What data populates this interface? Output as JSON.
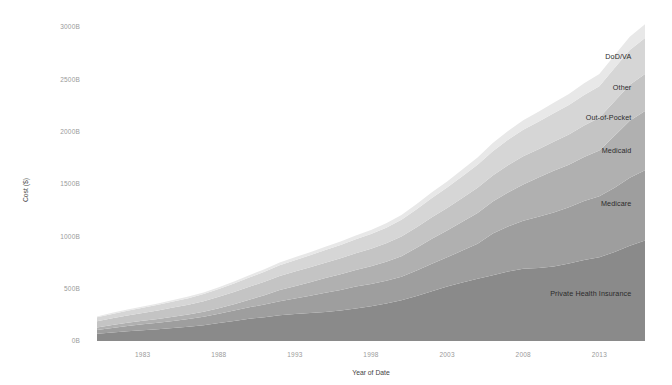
{
  "chart_data": {
    "type": "area",
    "stacked": true,
    "title": "",
    "xlabel": "Year of Date",
    "ylabel": "Cost ($)",
    "xlim": [
      1980,
      2016
    ],
    "ylim": [
      0,
      3000
    ],
    "grid": false,
    "legend_position": "inline-right",
    "x_tick_labels": [
      "1983",
      "1988",
      "1993",
      "1998",
      "2003",
      "2008",
      "2013"
    ],
    "x_ticks": [
      1983,
      1988,
      1993,
      1998,
      2003,
      2008,
      2013
    ],
    "y_tick_labels": [
      "0B",
      "500B",
      "1000B",
      "1500B",
      "2000B",
      "2500B",
      "3000B"
    ],
    "y_ticks": [
      0,
      500,
      1000,
      1500,
      2000,
      2500,
      3000
    ],
    "x": [
      1980,
      1981,
      1982,
      1983,
      1984,
      1985,
      1986,
      1987,
      1988,
      1989,
      1990,
      1991,
      1992,
      1993,
      1994,
      1995,
      1996,
      1997,
      1998,
      1999,
      2000,
      2001,
      2002,
      2003,
      2004,
      2005,
      2006,
      2007,
      2008,
      2009,
      2010,
      2011,
      2012,
      2013,
      2014,
      2015,
      2016
    ],
    "series": [
      {
        "name": "Private Health Insurance",
        "color": "#8a8a8a",
        "values": [
          70,
          82,
          94,
          103,
          113,
          124,
          135,
          150,
          172,
          192,
          212,
          228,
          246,
          259,
          268,
          278,
          292,
          310,
          333,
          359,
          390,
          430,
          475,
          520,
          560,
          595,
          628,
          665,
          690,
          698,
          712,
          740,
          775,
          800,
          850,
          910,
          960
        ]
      },
      {
        "name": "Medicare",
        "color": "#9e9e9e",
        "values": [
          36,
          43,
          50,
          56,
          61,
          68,
          74,
          81,
          88,
          99,
          110,
          120,
          134,
          146,
          164,
          182,
          196,
          210,
          212,
          216,
          224,
          243,
          262,
          279,
          305,
          335,
          398,
          428,
          459,
          489,
          516,
          538,
          562,
          583,
          615,
          649,
          672
        ]
      },
      {
        "name": "Medicaid",
        "color": "#b0b0b0",
        "values": [
          24,
          29,
          31,
          34,
          37,
          40,
          44,
          49,
          54,
          61,
          72,
          89,
          107,
          119,
          130,
          142,
          150,
          159,
          168,
          181,
          196,
          218,
          240,
          257,
          275,
          294,
          306,
          325,
          347,
          374,
          398,
          406,
          422,
          438,
          496,
          545,
          565
        ]
      },
      {
        "name": "Out-of-Pocket",
        "color": "#c4c4c4",
        "values": [
          58,
          63,
          69,
          75,
          81,
          87,
          93,
          100,
          108,
          116,
          124,
          129,
          134,
          139,
          142,
          146,
          152,
          159,
          168,
          177,
          188,
          196,
          205,
          214,
          226,
          239,
          250,
          261,
          268,
          271,
          278,
          289,
          300,
          311,
          330,
          344,
          353
        ]
      },
      {
        "name": "Other",
        "color": "#d6d6d6",
        "values": [
          38,
          42,
          46,
          50,
          54,
          58,
          63,
          68,
          74,
          81,
          89,
          96,
          103,
          109,
          115,
          121,
          127,
          133,
          141,
          150,
          160,
          172,
          185,
          196,
          208,
          220,
          232,
          244,
          255,
          263,
          272,
          282,
          292,
          302,
          318,
          332,
          344
        ]
      },
      {
        "name": "DoD/VA",
        "color": "#e8e8e8",
        "values": [
          9,
          10,
          11,
          12,
          13,
          14,
          15,
          16,
          18,
          20,
          22,
          24,
          26,
          28,
          30,
          32,
          34,
          36,
          39,
          42,
          45,
          49,
          54,
          59,
          65,
          71,
          77,
          83,
          89,
          95,
          101,
          106,
          111,
          116,
          122,
          128,
          133
        ]
      }
    ],
    "series_label_positions": [
      {
        "name": "Private Health Insurance",
        "x": 2013,
        "y": 430
      },
      {
        "name": "Medicare",
        "x": 2013,
        "y": 1290
      },
      {
        "name": "Medicaid",
        "x": 2013,
        "y": 1800
      },
      {
        "name": "Out-of-Pocket",
        "x": 2013,
        "y": 2110
      },
      {
        "name": "Other",
        "x": 2013,
        "y": 2400
      },
      {
        "name": "DoD/VA",
        "x": 2013,
        "y": 2690
      }
    ]
  },
  "axes": {
    "x_title": "Year of Date",
    "y_title": "Cost ($)"
  }
}
